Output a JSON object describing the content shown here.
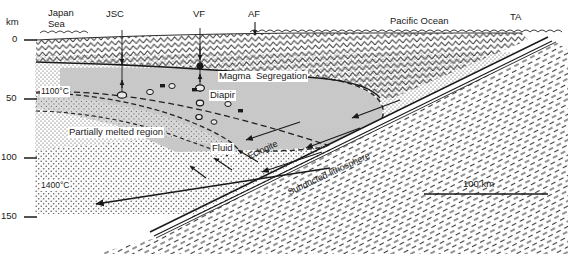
{
  "figure": {
    "type": "geologic-cross-section"
  },
  "depth_axis": {
    "unit_label": "km",
    "ticks": [
      {
        "label": "0",
        "depth_km": 0
      },
      {
        "label": "50",
        "depth_km": 50
      },
      {
        "label": "100",
        "depth_km": 100
      },
      {
        "label": "150",
        "depth_km": 150
      }
    ]
  },
  "surface_markers": [
    {
      "name": "japan-sea",
      "label": "Japan\nSea",
      "label_line1": "Japan",
      "label_line2": "Sea"
    },
    {
      "name": "jsc",
      "label": "JSC"
    },
    {
      "name": "vf",
      "label": "VF"
    },
    {
      "name": "af",
      "label": "AF"
    },
    {
      "name": "pacific-ocean",
      "label": "Pacific Ocean"
    },
    {
      "name": "ta",
      "label": "TA"
    }
  ],
  "annotations": [
    {
      "name": "isotherm-1100",
      "label": "1100°C"
    },
    {
      "name": "isotherm-1400",
      "label": "1400°C"
    },
    {
      "name": "magma-segregation",
      "label": "Magma  Segregation"
    },
    {
      "name": "diapir",
      "label": "Diapir"
    },
    {
      "name": "partially-melted-region",
      "label": "Partially melted region"
    },
    {
      "name": "fluid",
      "label": "Fluid"
    },
    {
      "name": "eclogite",
      "label": "Eclogite"
    },
    {
      "name": "subducted-lithosphere",
      "label": "Subducted lithosphere"
    }
  ],
  "scale_bar": {
    "label": "100 km",
    "length_km": 100
  },
  "colors": {
    "ink": "#1a1a1a",
    "crust_hatch": "#3a3a3a",
    "wedge_fill": "#c9c9c9",
    "melt_fill": "#b9b9b9",
    "slab_hatch": "#444444",
    "background": "#ffffff"
  }
}
